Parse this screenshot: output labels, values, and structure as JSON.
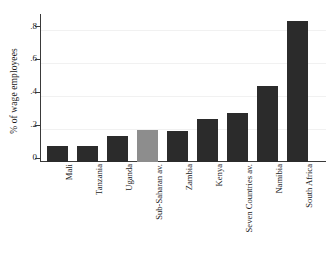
{
  "chart_data": {
    "type": "bar",
    "title": "",
    "subtitle": "",
    "xlabel": "",
    "ylabel": "% of wage employees",
    "categories": [
      "Mali",
      "Tanzania",
      "Uganda",
      "Sub-Saharan av.",
      "Zambia",
      "Kenya",
      "Seven Countries av.",
      "Namibia",
      "South Africa"
    ],
    "values": [
      0.1,
      0.1,
      0.16,
      0.195,
      0.19,
      0.26,
      0.3,
      0.46,
      0.855
    ],
    "ylim": [
      0,
      0.9
    ],
    "yticks": [
      0,
      0.2,
      0.4,
      0.6,
      0.8
    ],
    "ytick_labels": [
      "0",
      ".2",
      ".4",
      ".6",
      ".8"
    ],
    "grid": true,
    "legend": "none",
    "bar_color": "#2b2b2b",
    "highlight_color": "#8d8d8d",
    "highlight_index": 3,
    "gridline_color": "#f1f1f1",
    "axis_color": "#3a3a3a",
    "background": "#ffffff"
  }
}
